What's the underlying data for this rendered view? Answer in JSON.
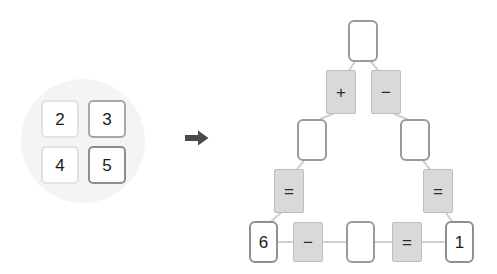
{
  "canvas": {
    "width": 497,
    "height": 274,
    "background": "#ffffff"
  },
  "colors": {
    "halo": "#f4f4f4",
    "tile_border_light": "#e2e2e2",
    "tile_border_dark": "#a8a8a8",
    "node_border": "#9a9a9a",
    "op_fill": "#d9d9d9",
    "op_border": "#bdbdbd",
    "edge": "#d0d0d0",
    "arrow": "#4a4a4a",
    "text": "#1a1a1a"
  },
  "left_panel": {
    "name": "tile-tray",
    "halo_shape": "circle",
    "grid": {
      "rows": 2,
      "cols": 2,
      "tiles": [
        {
          "label": "2",
          "style": "light"
        },
        {
          "label": "3",
          "style": "dark"
        },
        {
          "label": "4",
          "style": "light"
        },
        {
          "label": "5",
          "style": "darker"
        }
      ]
    }
  },
  "arrow": {
    "name": "right-arrow-icon",
    "direction": "right",
    "glyph": "➡"
  },
  "right_panel": {
    "name": "expression-tree",
    "nodes": [
      {
        "id": "n0",
        "kind": "blank",
        "label": "",
        "x": 108,
        "y": 20,
        "w": 30,
        "h": 42,
        "level": 0
      },
      {
        "id": "n1",
        "kind": "op",
        "label": "+",
        "x": 86,
        "y": 70,
        "w": 30,
        "h": 44,
        "level": 1
      },
      {
        "id": "n2",
        "kind": "op",
        "label": "−",
        "x": 131,
        "y": 70,
        "w": 30,
        "h": 44,
        "level": 1
      },
      {
        "id": "n3",
        "kind": "blank",
        "label": "",
        "x": 57,
        "y": 119,
        "w": 30,
        "h": 42,
        "level": 2
      },
      {
        "id": "n4",
        "kind": "blank",
        "label": "",
        "x": 160,
        "y": 119,
        "w": 30,
        "h": 42,
        "level": 2
      },
      {
        "id": "n5",
        "kind": "op",
        "label": "=",
        "x": 34,
        "y": 169,
        "w": 30,
        "h": 44,
        "level": 3
      },
      {
        "id": "n6",
        "kind": "op",
        "label": "=",
        "x": 183,
        "y": 169,
        "w": 30,
        "h": 44,
        "level": 3
      },
      {
        "id": "n7",
        "kind": "num",
        "label": "6",
        "x": 9,
        "y": 221,
        "w": 29,
        "h": 42,
        "level": 4
      },
      {
        "id": "n8",
        "kind": "op",
        "label": "−",
        "x": 53,
        "y": 222,
        "w": 30,
        "h": 40,
        "level": 4
      },
      {
        "id": "n9",
        "kind": "blank",
        "label": "",
        "x": 106,
        "y": 221,
        "w": 29,
        "h": 42,
        "level": 4
      },
      {
        "id": "n10",
        "kind": "op",
        "label": "=",
        "x": 152,
        "y": 222,
        "w": 30,
        "h": 40,
        "level": 4
      },
      {
        "id": "n11",
        "kind": "num",
        "label": "1",
        "x": 205,
        "y": 221,
        "w": 29,
        "h": 42,
        "level": 4
      }
    ],
    "edges": [
      {
        "from": "n0",
        "to": "n1"
      },
      {
        "from": "n0",
        "to": "n2"
      },
      {
        "from": "n1",
        "to": "n3"
      },
      {
        "from": "n2",
        "to": "n4"
      },
      {
        "from": "n3",
        "to": "n5"
      },
      {
        "from": "n4",
        "to": "n6"
      },
      {
        "from": "n5",
        "to": "n7"
      },
      {
        "from": "n6",
        "to": "n11"
      },
      {
        "from": "n7",
        "to": "n8"
      },
      {
        "from": "n8",
        "to": "n9"
      },
      {
        "from": "n9",
        "to": "n10"
      },
      {
        "from": "n10",
        "to": "n11"
      }
    ],
    "bottom_expression": [
      "6",
      "−",
      "",
      "=",
      "1"
    ]
  }
}
